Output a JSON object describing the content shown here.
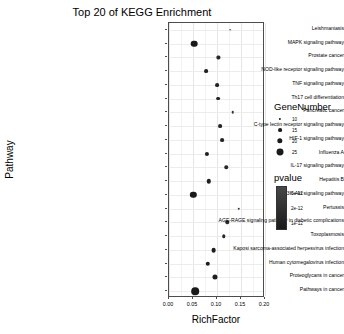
{
  "chart_data": {
    "type": "scatter",
    "title": "Top 20 of KEGG Enrichment",
    "xlabel": "RichFactor",
    "ylabel": "Pathway",
    "xlim": [
      0.0,
      0.2
    ],
    "xticks": [
      "0.00",
      "0.05",
      "0.10",
      "0.15",
      "0.20"
    ],
    "xtick_values": [
      0.0,
      0.05,
      0.1,
      0.15,
      0.2
    ],
    "grid": true,
    "legend_position": "right",
    "categories": [
      "Leishmaniasis",
      "MAPK signaling pathway",
      "Prostate cancer",
      "NOD-like receptor signaling pathway",
      "TNF signaling pathway",
      "Th17 cell differentiation",
      "Pancreatic cancer",
      "C-type lectin receptor signaling pathway",
      "HIF-1 signaling pathway",
      "Influenza A",
      "IL-17 signaling pathway",
      "Hepatitis B",
      "PI3K-Akt signaling pathway",
      "Pertussis",
      "AGE-RAGE signaling pathway in diabetic complications",
      "Toxoplasmosis",
      "Kaposi sarcoma-associated herpesvirus infection",
      "Human cytomegalovirus infection",
      "Proteoglycans in cancer",
      "Pathways in cancer"
    ],
    "points": [
      {
        "pathway": "Leishmaniasis",
        "richfactor": 0.128,
        "genenumber": 8,
        "pvalue": 2.8e-12
      },
      {
        "pathway": "MAPK signaling pathway",
        "richfactor": 0.052,
        "genenumber": 24,
        "pvalue": 1e-12
      },
      {
        "pathway": "Prostate cancer",
        "richfactor": 0.103,
        "genenumber": 13,
        "pvalue": 1.6e-12
      },
      {
        "pathway": "NOD-like receptor signaling pathway",
        "richfactor": 0.078,
        "genenumber": 15,
        "pvalue": 1.3e-12
      },
      {
        "pathway": "TNF signaling pathway",
        "richfactor": 0.101,
        "genenumber": 15,
        "pvalue": 1.4e-12
      },
      {
        "pathway": "Th17 cell differentiation",
        "richfactor": 0.102,
        "genenumber": 15,
        "pvalue": 1.5e-12
      },
      {
        "pathway": "Pancreatic cancer",
        "richfactor": 0.133,
        "genenumber": 11,
        "pvalue": 2.2e-12
      },
      {
        "pathway": "C-type lectin receptor signaling pathway",
        "richfactor": 0.106,
        "genenumber": 15,
        "pvalue": 1.5e-12
      },
      {
        "pathway": "HIF-1 signaling pathway",
        "richfactor": 0.11,
        "genenumber": 15,
        "pvalue": 1.5e-12
      },
      {
        "pathway": "Influenza A",
        "richfactor": 0.079,
        "genenumber": 16,
        "pvalue": 1.2e-12
      },
      {
        "pathway": "IL-17 signaling pathway",
        "richfactor": 0.119,
        "genenumber": 14,
        "pvalue": 1.7e-12
      },
      {
        "pathway": "Hepatitis B",
        "richfactor": 0.083,
        "genenumber": 17,
        "pvalue": 1.2e-12
      },
      {
        "pathway": "PI3K-Akt signaling pathway",
        "richfactor": 0.051,
        "genenumber": 23,
        "pvalue": 1e-12
      },
      {
        "pathway": "Pertussis",
        "richfactor": 0.145,
        "genenumber": 11,
        "pvalue": 2.4e-12
      },
      {
        "pathway": "AGE-RAGE signaling pathway in diabetic complications",
        "richfactor": 0.121,
        "genenumber": 14,
        "pvalue": 1.8e-12
      },
      {
        "pathway": "Toxoplasmosis",
        "richfactor": 0.114,
        "genenumber": 14,
        "pvalue": 1.6e-12
      },
      {
        "pathway": "Kaposi sarcoma-associated herpesvirus infection",
        "richfactor": 0.093,
        "genenumber": 18,
        "pvalue": 1.2e-12
      },
      {
        "pathway": "Human cytomegalovirus infection",
        "richfactor": 0.081,
        "genenumber": 17,
        "pvalue": 1.1e-12
      },
      {
        "pathway": "Proteoglycans in cancer",
        "richfactor": 0.095,
        "genenumber": 19,
        "pvalue": 1.2e-12
      },
      {
        "pathway": "Pathways in cancer",
        "richfactor": 0.054,
        "genenumber": 27,
        "pvalue": 1e-12
      }
    ],
    "legends": {
      "size": {
        "title": "GeneNumber",
        "entries": [
          {
            "label": "10",
            "value": 10
          },
          {
            "label": "15",
            "value": 15
          },
          {
            "label": "20",
            "value": 20
          },
          {
            "label": "25",
            "value": 25
          }
        ]
      },
      "color": {
        "title": "pvalue",
        "ticks": [
          "3e-12",
          "2e-12",
          "1e-12"
        ],
        "tick_values": [
          3e-12,
          2e-12,
          1e-12
        ],
        "high_color": "#1a1a1a",
        "low_color": "#4a4a4a"
      }
    }
  }
}
